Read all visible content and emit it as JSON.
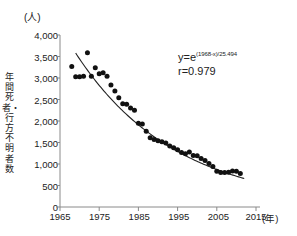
{
  "chart_data": {
    "type": "scatter",
    "title": "",
    "subtitle": "",
    "xlabel": "年",
    "ylabel": "年間死者・行方不明者数",
    "yunit": "(人)",
    "xunit": "(年)",
    "xlim": [
      1965,
      2015
    ],
    "ylim": [
      0,
      4000
    ],
    "xticks": [
      1965,
      1975,
      1985,
      1995,
      2005,
      2015
    ],
    "xticklabels": [
      "1965",
      "1975",
      "1985",
      "1995",
      "2005",
      "2015"
    ],
    "yticks": [
      0,
      500,
      1000,
      1500,
      2000,
      2500,
      3000,
      3500,
      4000
    ],
    "yticklabels": [
      "0",
      "500",
      "1,000",
      "1,500",
      "2,000",
      "2,500",
      "3,000",
      "3,500",
      "4,000"
    ],
    "grid": false,
    "legend": false,
    "marker_color": "#111111",
    "line_color": "#222222",
    "axis_color": "#8a8a8a",
    "annotations": {
      "equation_prefix": "y=e",
      "equation_exponent": "(1968-x)/25.494",
      "correlation": "r=0.979"
    },
    "series": [
      {
        "name": "年間死者・行方不明者数",
        "x": [
          1968,
          1969,
          1970,
          1971,
          1972,
          1973,
          1974,
          1975,
          1976,
          1977,
          1978,
          1979,
          1980,
          1981,
          1982,
          1983,
          1984,
          1985,
          1986,
          1987,
          1988,
          1989,
          1990,
          1991,
          1992,
          1993,
          1994,
          1995,
          1996,
          1997,
          1998,
          1999,
          2000,
          2001,
          2002,
          2003,
          2004,
          2005,
          2006,
          2007,
          2008,
          2009,
          2010,
          2011
        ],
        "values": [
          3270,
          3030,
          3030,
          3040,
          3590,
          3040,
          3240,
          3100,
          3120,
          3040,
          2840,
          2700,
          2540,
          2400,
          2390,
          2300,
          2250,
          1950,
          1930,
          1760,
          1610,
          1570,
          1540,
          1520,
          1490,
          1420,
          1380,
          1330,
          1270,
          1240,
          1280,
          1200,
          1190,
          1130,
          1080,
          1010,
          940,
          830,
          800,
          800,
          810,
          840,
          830,
          780
        ],
        "marker": "circle"
      }
    ],
    "fit_curve": {
      "name": "exponential-fit",
      "formula": "y=e^((1968-x)/25.494)",
      "r": 0.979,
      "x_start": 1969,
      "x_end": 2012
    }
  }
}
